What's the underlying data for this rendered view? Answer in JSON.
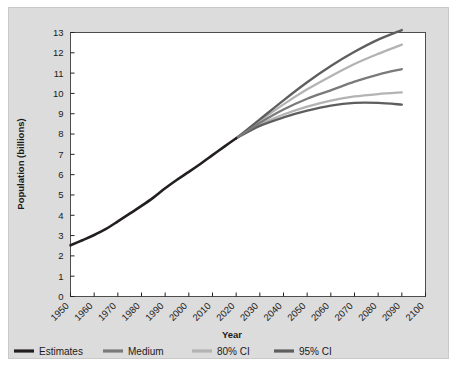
{
  "chart_data": {
    "type": "line",
    "title": "",
    "xlabel": "Year",
    "ylabel": "Population (billions)",
    "xlim": [
      1950,
      2100
    ],
    "ylim": [
      0,
      13
    ],
    "grid": false,
    "legend_position": "bottom",
    "xticks": [
      "1950",
      "1960",
      "1970",
      "1980",
      "1990",
      "2000",
      "2010",
      "2020",
      "2030",
      "2040",
      "2050",
      "2060",
      "2070",
      "2080",
      "2090",
      "2100"
    ],
    "yticks": [
      "0",
      "1",
      "2",
      "3",
      "4",
      "5",
      "6",
      "7",
      "8",
      "9",
      "10",
      "11",
      "12",
      "13"
    ],
    "x": [
      1950,
      1960,
      1970,
      1980,
      1990,
      2000,
      2010,
      2020,
      2030,
      2040,
      2050,
      2060,
      2070,
      2080,
      2090
    ],
    "series": [
      {
        "name": "Estimates",
        "color": "#231f20",
        "x": [
          1950,
          1955,
          1960,
          1965,
          1970,
          1975,
          1980,
          1985,
          1990,
          1995,
          2000,
          2005,
          2010,
          2015,
          2020
        ],
        "values": [
          2.52,
          2.77,
          3.03,
          3.33,
          3.7,
          4.08,
          4.46,
          4.87,
          5.33,
          5.75,
          6.14,
          6.54,
          6.96,
          7.38,
          7.79
        ]
      },
      {
        "name": "Medium",
        "color": "#7a7a7a",
        "x": [
          2020,
          2030,
          2040,
          2050,
          2060,
          2070,
          2080,
          2090
        ],
        "values": [
          7.79,
          8.55,
          9.21,
          9.74,
          10.15,
          10.58,
          10.93,
          11.2
        ]
      },
      {
        "name": "80% CI upper",
        "color": "#b3b3b3",
        "x": [
          2020,
          2030,
          2040,
          2050,
          2060,
          2070,
          2080,
          2090
        ],
        "values": [
          7.79,
          8.64,
          9.46,
          10.2,
          10.85,
          11.45,
          11.95,
          12.4
        ]
      },
      {
        "name": "80% CI lower",
        "color": "#b3b3b3",
        "x": [
          2020,
          2030,
          2040,
          2050,
          2060,
          2070,
          2080,
          2090
        ],
        "values": [
          7.79,
          8.46,
          8.96,
          9.35,
          9.65,
          9.85,
          9.97,
          10.05
        ]
      },
      {
        "name": "95% CI upper",
        "color": "#5e5e5e",
        "x": [
          2020,
          2030,
          2040,
          2050,
          2060,
          2070,
          2080,
          2090
        ],
        "values": [
          7.79,
          8.72,
          9.66,
          10.55,
          11.35,
          12.05,
          12.65,
          13.12
        ]
      },
      {
        "name": "95% CI lower",
        "color": "#5e5e5e",
        "x": [
          2020,
          2030,
          2040,
          2050,
          2060,
          2070,
          2080,
          2090
        ],
        "values": [
          7.79,
          8.4,
          8.82,
          9.15,
          9.4,
          9.53,
          9.53,
          9.45
        ]
      }
    ],
    "legend": [
      {
        "label": "Estimates",
        "color": "#231f20"
      },
      {
        "label": "Medium",
        "color": "#7a7a7a"
      },
      {
        "label": "80% CI",
        "color": "#b3b3b3"
      },
      {
        "label": "95% CI",
        "color": "#5e5e5e"
      }
    ]
  },
  "colors": {
    "panel_background": "#dcdcdc",
    "plot_background": "#ffffff",
    "axis": "#231f20",
    "text": "#1a1a1a"
  }
}
